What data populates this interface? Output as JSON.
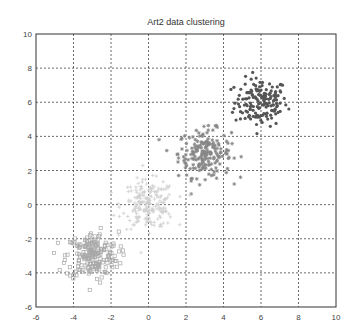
{
  "chart_data": {
    "type": "scatter",
    "title": "Art2 data clustering",
    "xlabel": "",
    "ylabel": "",
    "xlim": [
      -6,
      10
    ],
    "ylim": [
      -6,
      10
    ],
    "xticks": [
      -6,
      -4,
      -2,
      0,
      2,
      4,
      6,
      8,
      10
    ],
    "yticks": [
      -6,
      -4,
      -2,
      0,
      2,
      4,
      6,
      8,
      10
    ],
    "grid": true,
    "legend": null,
    "series": [
      {
        "name": "cluster 1",
        "center": [
          6,
          6
        ],
        "spread": 0.7,
        "count": 160,
        "marker": "dot",
        "color": "#555555"
      },
      {
        "name": "cluster 2",
        "center": [
          3,
          3
        ],
        "spread": 0.7,
        "count": 200,
        "marker": "asterisk",
        "color": "#888888"
      },
      {
        "name": "cluster 3",
        "center": [
          0,
          0
        ],
        "spread": 0.7,
        "count": 200,
        "marker": "plus",
        "color": "#d0d0d0"
      },
      {
        "name": "cluster 4",
        "center": [
          -3,
          -3
        ],
        "spread": 0.7,
        "count": 200,
        "marker": "star",
        "color": "#a8a8a8"
      }
    ]
  }
}
